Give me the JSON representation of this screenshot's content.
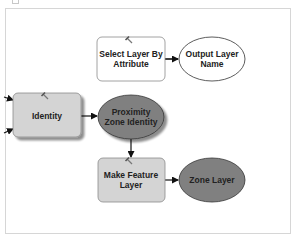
{
  "diagram": {
    "type": "model-builder-flowchart",
    "nodes": [
      {
        "id": "select-layer-by-attribute",
        "kind": "tool",
        "lines": [
          "Select Layer By",
          "Attribute"
        ],
        "fill": "#ffffff",
        "icon": "hammer-icon"
      },
      {
        "id": "output-layer-name",
        "kind": "data",
        "lines": [
          "Output Layer",
          "Name"
        ],
        "fill": "#ffffff"
      },
      {
        "id": "identity",
        "kind": "tool",
        "lines": [
          "Identity"
        ],
        "fill": "#d4d4d4",
        "icon": "hammer-icon"
      },
      {
        "id": "proximity-zone-identity",
        "kind": "data",
        "lines": [
          "Proximity",
          "Zone Identity"
        ],
        "fill": "#808080"
      },
      {
        "id": "make-feature-layer",
        "kind": "tool",
        "lines": [
          "Make Feature",
          "Layer"
        ],
        "fill": "#d4d4d4",
        "icon": "hammer-icon"
      },
      {
        "id": "zone-layer",
        "kind": "data",
        "lines": [
          "Zone Layer"
        ],
        "fill": "#808080"
      }
    ],
    "edges": [
      {
        "from": "select-layer-by-attribute",
        "to": "output-layer-name"
      },
      {
        "from": "identity",
        "to": "proximity-zone-identity"
      },
      {
        "from": "proximity-zone-identity",
        "to": "make-feature-layer"
      },
      {
        "from": "make-feature-layer",
        "to": "zone-layer"
      },
      {
        "from": "offscreen-input-1",
        "to": "identity"
      },
      {
        "from": "offscreen-input-2",
        "to": "identity"
      }
    ],
    "colors": {
      "tool_ready": "#ffffff",
      "tool_run": "#d4d4d4",
      "derived_data": "#808080",
      "connector": "#111111",
      "frame_border": "#d6d6d6"
    }
  }
}
